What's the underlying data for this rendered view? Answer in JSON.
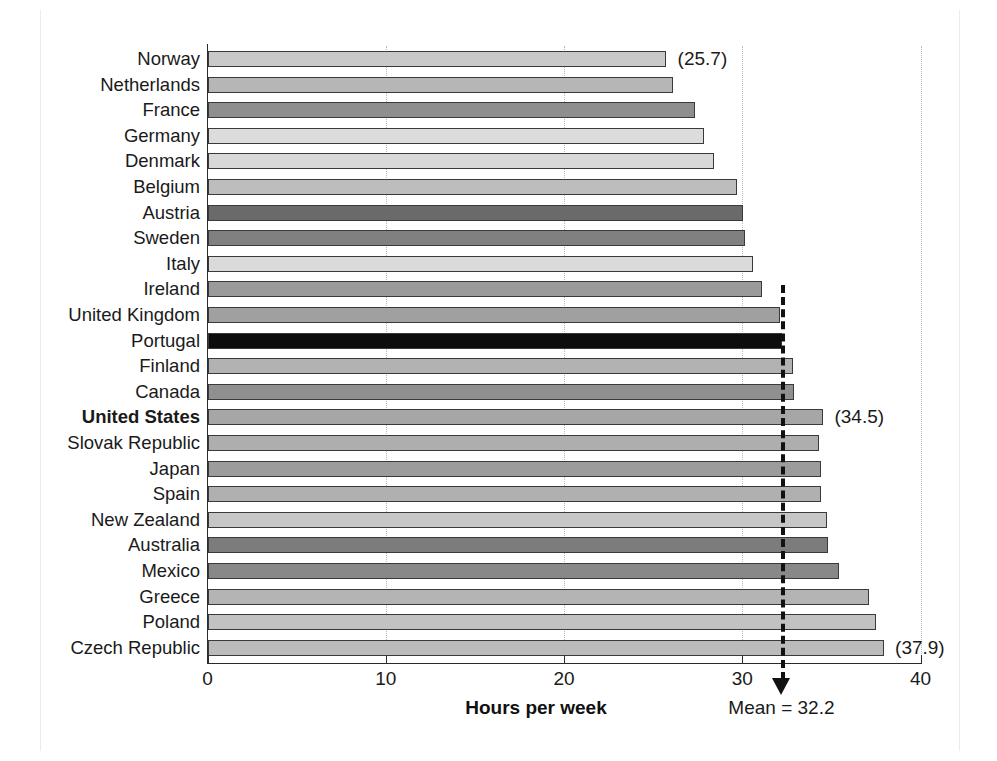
{
  "chart_data": {
    "type": "bar",
    "orientation": "horizontal",
    "title": "",
    "xlabel": "Hours per week",
    "ylabel": "",
    "xlim": [
      0,
      40
    ],
    "xticks": [
      0,
      10,
      20,
      30,
      40
    ],
    "xticklabels": [
      "0",
      "10",
      "20",
      "30",
      "40"
    ],
    "grid": "vertical dotted gridlines at 10, 20, 30, 40",
    "legend": "none",
    "categories": [
      "Norway",
      "Netherlands",
      "France",
      "Germany",
      "Denmark",
      "Belgium",
      "Austria",
      "Sweden",
      "Italy",
      "Ireland",
      "United Kingdom",
      "Portugal",
      "Finland",
      "Canada",
      "United States",
      "Slovak Republic",
      "Japan",
      "Spain",
      "New Zealand",
      "Australia",
      "Mexico",
      "Greece",
      "Poland",
      "Czech Republic"
    ],
    "values": [
      25.7,
      26.1,
      27.3,
      27.8,
      28.4,
      29.7,
      30.0,
      30.1,
      30.6,
      31.1,
      32.1,
      32.2,
      32.8,
      32.9,
      34.5,
      34.3,
      34.4,
      34.4,
      34.7,
      34.8,
      35.4,
      37.1,
      37.5,
      37.9
    ],
    "bar_shades": [
      "#c9c9c9",
      "#b6b6b6",
      "#8e8e8e",
      "#dcdcdc",
      "#d8d8d8",
      "#bdbdbd",
      "#6a6a6a",
      "#808080",
      "#dadada",
      "#9a9a9a",
      "#a0a0a0",
      "#0d0d0d",
      "#b2b2b2",
      "#909090",
      "#a6a6a6",
      "#aeaeae",
      "#9c9c9c",
      "#b0b0b0",
      "#c6c6c6",
      "#7c7c7c",
      "#888888",
      "#b4b4b4",
      "#c2c2c2",
      "#bbbbbb"
    ],
    "highlighted_category": "United States",
    "value_annotations": [
      {
        "category": "Norway",
        "text": "(25.7)"
      },
      {
        "category": "United States",
        "text": "(34.5)"
      },
      {
        "category": "Czech Republic",
        "text": "(37.9)"
      }
    ],
    "mean": {
      "value": 32.2,
      "label": "Mean  =  32.2",
      "marker": "dashed vertical line with downward arrow"
    }
  }
}
